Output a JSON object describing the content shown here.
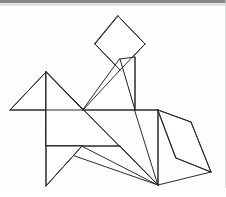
{
  "figure": {
    "stroke_color": "#2b2b2f",
    "fill_color": "#ffffff",
    "background_color": "#fdfdfd",
    "canvas": {
      "width": 226,
      "height": 197
    },
    "piece_count": 7
  },
  "decor": {
    "top_band_color": "#6f7377",
    "top_band_soft_color": "#d8dade",
    "right_rule_color": "#c9ccd0"
  },
  "chart_data": {
    "type": "diagram",
    "pieces": [
      {
        "name": "head-square",
        "shape": "square",
        "role": "head",
        "points": "118,16 145,44 120,70 95,44"
      },
      {
        "name": "neck-triangle",
        "shape": "triangle",
        "role": "neck",
        "points": "120,59 135,57 135,110"
      },
      {
        "name": "neck-triangle-lower",
        "shape": "triangle",
        "role": "neck-lower",
        "points": "120,59 135,110 83,110"
      },
      {
        "name": "head-ear-triangle",
        "shape": "triangle",
        "role": "ear",
        "points": "46,72 10,110 83,110"
      },
      {
        "name": "body-large-triangle",
        "shape": "triangle",
        "role": "body",
        "points": "46,72 158,185 46,146"
      },
      {
        "name": "hindquarter-square",
        "shape": "square",
        "role": "hindquarters",
        "points": "135,110 158,110 158,185"
      },
      {
        "name": "front-leg-triangle",
        "shape": "triangle",
        "role": "front-leg",
        "points": "46,146 46,186 82,146"
      },
      {
        "name": "rear-haunch-triangle",
        "shape": "triangle",
        "role": "rear-haunch",
        "points": "82,146 120,146 158,185"
      },
      {
        "name": "tail-parallelogram",
        "shape": "parallelogram",
        "role": "tail",
        "points": "158,110 191,122 211,172 176,158"
      }
    ],
    "segments": [
      {
        "name": "head-square-top-left",
        "x1": 118,
        "y1": 16,
        "x2": 95,
        "y2": 44
      },
      {
        "name": "head-square-top-right",
        "x1": 118,
        "y1": 16,
        "x2": 145,
        "y2": 44
      },
      {
        "name": "head-square-bottom-left",
        "x1": 95,
        "y1": 44,
        "x2": 120,
        "y2": 70
      },
      {
        "name": "head-square-bottom-right",
        "x1": 145,
        "y1": 44,
        "x2": 120,
        "y2": 70
      },
      {
        "name": "neck-vertical",
        "x1": 135,
        "y1": 57,
        "x2": 135,
        "y2": 110
      },
      {
        "name": "neck-diagonal",
        "x1": 120,
        "y1": 70,
        "x2": 83,
        "y2": 110
      },
      {
        "name": "back-horizontal",
        "x1": 83,
        "y1": 110,
        "x2": 158,
        "y2": 110
      },
      {
        "name": "ear-left-edge",
        "x1": 46,
        "y1": 72,
        "x2": 10,
        "y2": 110
      },
      {
        "name": "ear-bottom-edge",
        "x1": 10,
        "y1": 110,
        "x2": 83,
        "y2": 110
      },
      {
        "name": "ear-right-edge",
        "x1": 46,
        "y1": 72,
        "x2": 83,
        "y2": 110
      },
      {
        "name": "chest-vertical",
        "x1": 46,
        "y1": 72,
        "x2": 46,
        "y2": 186
      },
      {
        "name": "body-diagonal",
        "x1": 46,
        "y1": 72,
        "x2": 158,
        "y2": 185
      },
      {
        "name": "belly-horizontal",
        "x1": 46,
        "y1": 146,
        "x2": 120,
        "y2": 146
      },
      {
        "name": "front-leg-diagonal",
        "x1": 46,
        "y1": 186,
        "x2": 82,
        "y2": 146
      },
      {
        "name": "rear-leg-vertical",
        "x1": 158,
        "y1": 110,
        "x2": 158,
        "y2": 185
      },
      {
        "name": "tail-top-edge",
        "x1": 158,
        "y1": 110,
        "x2": 191,
        "y2": 122
      },
      {
        "name": "tail-right-edge",
        "x1": 191,
        "y1": 122,
        "x2": 211,
        "y2": 172
      },
      {
        "name": "tail-bottom-edge",
        "x1": 211,
        "y1": 172,
        "x2": 176,
        "y2": 158
      },
      {
        "name": "tail-left-edge",
        "x1": 176,
        "y1": 158,
        "x2": 158,
        "y2": 110
      },
      {
        "name": "tail-lower-join",
        "x1": 158,
        "y1": 185,
        "x2": 211,
        "y2": 172
      }
    ]
  }
}
